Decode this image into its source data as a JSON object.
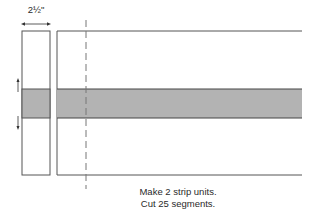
{
  "dimension": {
    "label": "2½\""
  },
  "caption": {
    "line1": "Make 2 strip units.",
    "line2": "Cut 25 segments."
  },
  "colors": {
    "outline": "#555555",
    "band": "#b3b3b3",
    "dash": "#777777"
  },
  "diagram": {
    "segment": {
      "x": 22,
      "y": 31,
      "w": 28,
      "h": 144
    },
    "strip_unit": {
      "x": 57,
      "y": 31,
      "w": 245,
      "h": 144
    },
    "band": {
      "y": 89,
      "h": 29
    },
    "cut_line_x": 86
  }
}
